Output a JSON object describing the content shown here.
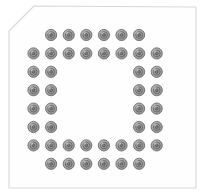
{
  "component": {
    "kind": "bga-package-footprint",
    "title": "BGA Package Footprint",
    "view": "bottom-view-pad-layout",
    "canvas": {
      "width": 205,
      "height": 195
    },
    "background_color": "#ffffff"
  },
  "body_outline": {
    "name": "package-body",
    "shape": "chamfered-rectangle",
    "fill_color": "#fefefe",
    "stroke_color": "#d8d8d8",
    "stroke_width": 1.1,
    "chamfer_corner": "top-left",
    "chamfer_size": 26,
    "bounds": {
      "x": 8,
      "y": 6,
      "width": 189,
      "height": 183
    },
    "points": "34,6 196,7 196,188 9,188 9,31"
  },
  "pad_style": {
    "name": "solder-ball-pad",
    "outer_radius": 5.6,
    "outer_fill": "#a8a8a8",
    "outer_stroke": "#6e6e6e",
    "outer_stroke_width": 0.9,
    "mid_radius": 3.4,
    "mid_fill": "#9a9a9a",
    "mid_stroke": "#5f5f5f",
    "mid_stroke_width": 0.8,
    "inner_radius": 1.5,
    "inner_fill": "#7d7d7d",
    "inner_stroke": "#4d4d4d",
    "inner_stroke_width": 0.7,
    "highlight_color": "#c9c9c9"
  },
  "grid": {
    "columns": 8,
    "rows": 8,
    "pitch_x": 17.6,
    "pitch_y": 18.4,
    "origin_x": 33.5,
    "origin_y": 35.0,
    "column_labels": [
      "1",
      "2",
      "3",
      "4",
      "5",
      "6",
      "7",
      "8"
    ],
    "row_labels": [
      "A",
      "B",
      "C",
      "D",
      "E",
      "F",
      "G",
      "H"
    ],
    "total_pads": 44,
    "pattern": "perimeter-ring-with-double-edge-rows",
    "occupancy": [
      [
        0,
        1,
        1,
        1,
        1,
        1,
        1,
        0
      ],
      [
        1,
        1,
        1,
        1,
        1,
        1,
        1,
        1
      ],
      [
        1,
        1,
        0,
        0,
        0,
        0,
        1,
        1
      ],
      [
        1,
        1,
        0,
        0,
        0,
        0,
        1,
        1
      ],
      [
        1,
        1,
        0,
        0,
        0,
        0,
        1,
        1
      ],
      [
        1,
        1,
        0,
        0,
        0,
        0,
        1,
        1
      ],
      [
        1,
        1,
        1,
        1,
        1,
        1,
        1,
        1
      ],
      [
        0,
        1,
        1,
        1,
        1,
        1,
        1,
        0
      ]
    ],
    "row_counts": [
      6,
      8,
      4,
      4,
      4,
      4,
      8,
      6
    ]
  }
}
